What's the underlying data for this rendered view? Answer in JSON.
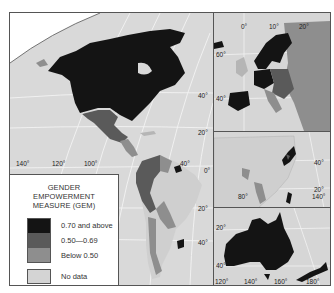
{
  "map": {
    "type": "choropleth",
    "subject": "Gender Empowerment Measure (GEM)",
    "main_panel": {
      "region": "Americas",
      "lat_labels": [
        "40°",
        "20°",
        "0°",
        "20°",
        "40°"
      ],
      "lon_labels": [
        "140°",
        "120°",
        "100°",
        "40°"
      ]
    },
    "insets": [
      {
        "region": "Europe",
        "lat_labels": [
          "60°",
          "40°"
        ],
        "lon_labels": [
          "0°",
          "10°",
          "20°"
        ]
      },
      {
        "region": "Asia",
        "lat_labels": [
          "40°",
          "20°"
        ],
        "lon_labels": [
          "80°",
          "140°"
        ]
      },
      {
        "region": "Australia / New Zealand",
        "lat_labels": [
          "20°",
          "40°"
        ],
        "lon_labels": [
          "120°",
          "140°",
          "160°",
          "180°"
        ]
      }
    ]
  },
  "legend": {
    "title_lines": [
      "GENDER",
      "EMPOWERMENT",
      "MEASURE (GEM)"
    ],
    "items": [
      {
        "label": "0.70 and above",
        "color": "#141414"
      },
      {
        "label": "0.50—0.69",
        "color": "#5a5a5a"
      },
      {
        "label": "Below 0.50",
        "color": "#8e8e8e"
      },
      {
        "label": "No data",
        "color": "#d4d4d4"
      }
    ]
  },
  "colors": {
    "ocean": "#d9d9d9",
    "land_nodata": "#cfcfcf",
    "high": "#141414",
    "mid": "#5a5a5a",
    "low": "#8e8e8e",
    "grid": "#f2f2f2"
  }
}
